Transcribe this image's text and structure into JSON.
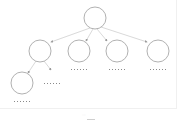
{
  "diagram": {
    "type": "tree",
    "colors": {
      "node_stroke": "#a8a8a8",
      "edge_stroke": "#c8c8c8",
      "arrow_fill": "#9a9a9a",
      "label_dots": "#8a8a8a"
    },
    "nodes": [
      {
        "id": "root",
        "cx": 95,
        "cy": 18,
        "r": 11,
        "label": "······"
      },
      {
        "id": "child-1",
        "cx": 40,
        "cy": 51,
        "r": 11,
        "label": ""
      },
      {
        "id": "child-2",
        "cx": 79,
        "cy": 51,
        "r": 11,
        "label": "······"
      },
      {
        "id": "child-3",
        "cx": 117,
        "cy": 51,
        "r": 11,
        "label": "······"
      },
      {
        "id": "child-4",
        "cx": 158,
        "cy": 51,
        "r": 11,
        "label": "······"
      },
      {
        "id": "grandchild-1",
        "cx": 22,
        "cy": 83,
        "r": 11,
        "label": "······"
      },
      {
        "id": "leaf-stub",
        "label": "······"
      }
    ],
    "caption": "····"
  }
}
